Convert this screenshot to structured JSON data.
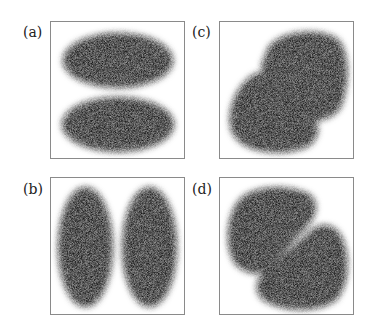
{
  "figure": {
    "panels": [
      {
        "id": "a",
        "label": "(a)",
        "description": "two horizontal lobes stacked vertically"
      },
      {
        "id": "b",
        "label": "(b)",
        "description": "two vertical lobes side by side"
      },
      {
        "id": "c",
        "label": "(c)",
        "description": "two lobes along anti-diagonal (top-right and bottom-left)"
      },
      {
        "id": "d",
        "label": "(d)",
        "description": "two lobes along diagonal (top-left and bottom-right)"
      }
    ],
    "colors": {
      "lobe": "#111111",
      "frame": "#8a8a8a",
      "background": "#ffffff"
    }
  }
}
